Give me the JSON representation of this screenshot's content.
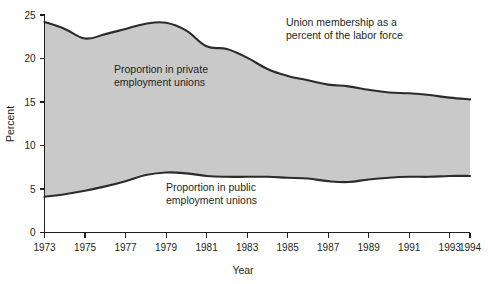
{
  "chart_data": {
    "type": "area",
    "title": "",
    "xlabel": "Year",
    "ylabel": "Percent",
    "xlim": [
      1973,
      1994
    ],
    "ylim": [
      0,
      25
    ],
    "ytick_labels": [
      "0",
      "5",
      "10",
      "15",
      "20",
      "25"
    ],
    "yticks": [
      0,
      5,
      10,
      15,
      20,
      25
    ],
    "xtick_labels": [
      "1973",
      "1975",
      "1977",
      "1979",
      "1981",
      "1983",
      "1985",
      "1987",
      "1989",
      "1991",
      "1993",
      "1994"
    ],
    "xticks": [
      1973,
      1975,
      1977,
      1979,
      1981,
      1983,
      1985,
      1987,
      1989,
      1991,
      1993,
      1994
    ],
    "grid": false,
    "legend_position": "inline-annotations",
    "x": [
      1973,
      1974,
      1975,
      1976,
      1977,
      1978,
      1979,
      1980,
      1981,
      1982,
      1983,
      1984,
      1985,
      1986,
      1987,
      1988,
      1989,
      1990,
      1991,
      1992,
      1993,
      1994
    ],
    "series": [
      {
        "name": "Union membership as a percent of the labor force",
        "values": [
          24.2,
          23.4,
          22.3,
          22.8,
          23.4,
          24.0,
          24.1,
          23.2,
          21.4,
          21.1,
          20.1,
          18.8,
          18.0,
          17.5,
          17.0,
          16.8,
          16.4,
          16.1,
          16.0,
          15.8,
          15.5,
          15.3
        ]
      },
      {
        "name": "Proportion in public employment unions",
        "values": [
          4.1,
          4.4,
          4.8,
          5.3,
          5.9,
          6.6,
          6.9,
          6.8,
          6.5,
          6.4,
          6.4,
          6.4,
          6.3,
          6.2,
          5.9,
          5.8,
          6.1,
          6.3,
          6.4,
          6.4,
          6.5,
          6.5
        ]
      }
    ],
    "annotations": [
      {
        "name": "total-annotation",
        "lines": [
          "Union membership as a",
          "percent of the labor force"
        ],
        "x_px": 286,
        "y_px": 26
      },
      {
        "name": "private-annotation",
        "lines": [
          "Proportion in private",
          "employment unions"
        ],
        "x_px": 114,
        "y_px": 73
      },
      {
        "name": "public-annotation",
        "lines": [
          "Proportion in public",
          "employment unions"
        ],
        "x_px": 166,
        "y_px": 191
      }
    ],
    "colors": {
      "band_fill": "#c9c9c9",
      "line": "#2b2b2b",
      "axis": "#231f20",
      "background": "#ffffff"
    }
  }
}
